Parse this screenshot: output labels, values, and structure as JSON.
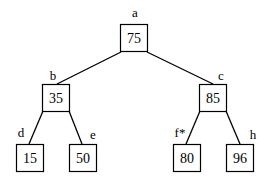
{
  "diagram": {
    "type": "binary-tree",
    "nodes": [
      {
        "id": "a",
        "label": "a",
        "value": "75"
      },
      {
        "id": "b",
        "label": "b",
        "value": "35"
      },
      {
        "id": "c",
        "label": "c",
        "value": "85"
      },
      {
        "id": "d",
        "label": "d",
        "value": "15"
      },
      {
        "id": "e",
        "label": "e",
        "value": "50"
      },
      {
        "id": "f",
        "label": "f*",
        "value": "80"
      },
      {
        "id": "h",
        "label": "h",
        "value": "96"
      }
    ],
    "edges": [
      {
        "from": "a",
        "to": "b"
      },
      {
        "from": "a",
        "to": "c"
      },
      {
        "from": "b",
        "to": "d"
      },
      {
        "from": "b",
        "to": "e"
      },
      {
        "from": "c",
        "to": "f"
      },
      {
        "from": "c",
        "to": "h"
      }
    ]
  }
}
